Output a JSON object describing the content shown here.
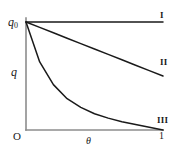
{
  "figure": {
    "background_color": "#ffffff",
    "axis_color": "#8c8c8c",
    "curve_color": "#1a1a1a"
  },
  "axes": {
    "y_label": "q",
    "x_label": "θ",
    "origin_label": "O",
    "y_top_label": "q",
    "y_top_subscript": "0",
    "x_max_tick": "1"
  },
  "curve_labels": {
    "one": "I",
    "two": "II",
    "three": "III"
  },
  "chart_data": {
    "type": "line",
    "title": "",
    "subtitle": "",
    "xlabel": "θ",
    "ylabel": "q",
    "xlim": [
      0,
      1
    ],
    "ylim": [
      0,
      1
    ],
    "xticks": [
      0,
      1
    ],
    "xticklabels": [
      "O",
      "1"
    ],
    "yticks": [
      0,
      1
    ],
    "yticklabels": [
      "0",
      "q0"
    ],
    "grid": false,
    "legend": "inline-right-end-labels",
    "annotations": [
      "I",
      "II",
      "III"
    ],
    "x": [
      0,
      0.1,
      0.2,
      0.3,
      0.4,
      0.5,
      0.6,
      0.7,
      0.8,
      0.9,
      1
    ],
    "series": [
      {
        "name": "I",
        "label": "I",
        "description": "constant, q stays at q0 for all theta",
        "values": [
          1,
          1,
          1,
          1,
          1,
          1,
          1,
          1,
          1,
          1,
          1
        ]
      },
      {
        "name": "II",
        "label": "II",
        "description": "linear decrease from q0 to about 0.5 q0",
        "values": [
          1,
          0.95,
          0.9,
          0.85,
          0.8,
          0.75,
          0.7,
          0.65,
          0.6,
          0.55,
          0.5
        ]
      },
      {
        "name": "III",
        "label": "III",
        "description": "convex exponential-like decay from q0 to 0",
        "values": [
          1,
          0.63,
          0.42,
          0.29,
          0.21,
          0.15,
          0.11,
          0.077,
          0.05,
          0.025,
          0
        ]
      }
    ]
  }
}
